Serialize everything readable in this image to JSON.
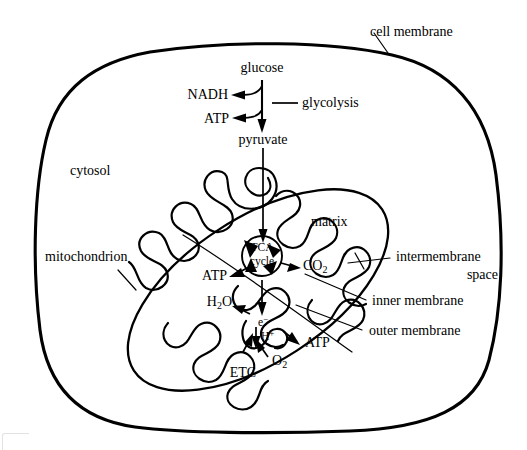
{
  "diagram": {
    "background_color": "#ffffff",
    "line_color": "#000000",
    "labels": {
      "cell_membrane": "cell membrane",
      "cytosol": "cytosol",
      "mitochondrion": "mitochondrion",
      "matrix": "matrix",
      "intermembrane_space_line1": "intermembrane",
      "intermembrane_space_line2": "space",
      "inner_membrane": "inner membrane",
      "outer_membrane": "outer membrane"
    },
    "glycolysis": {
      "substrate": "glucose",
      "product": "pyruvate",
      "pathway": "glycolysis",
      "byproduct_1": "NADH",
      "byproduct_2": "ATP"
    },
    "tca": {
      "name_line1": "TCA",
      "name_line2": "cycle",
      "output_atp": "ATP",
      "output_co2_base": "CO",
      "output_co2_sub": "2",
      "output_h2o_base_1": "H",
      "output_h2o_sub": "2",
      "output_h2o_base_2": "O"
    },
    "etc": {
      "name": "ETC",
      "electron_base": "e",
      "electron_sup": "−",
      "proton_base": "H",
      "proton_sup": "+",
      "oxygen_base": "O",
      "oxygen_sub": "2",
      "atp": "ATP"
    }
  }
}
